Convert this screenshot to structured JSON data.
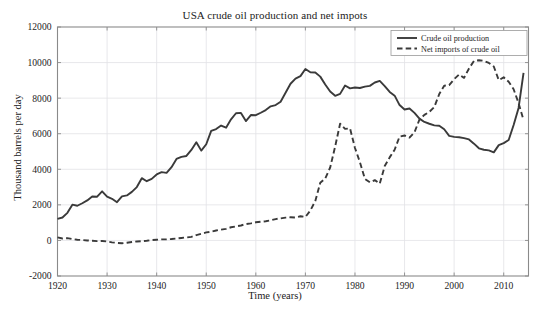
{
  "chart_data": {
    "type": "line",
    "title": "USA crude oil production and net impots",
    "xlabel": "Time (years)",
    "ylabel": "Thousand barrels per day",
    "xlim": [
      1920,
      2015
    ],
    "ylim": [
      -2000,
      12000
    ],
    "xticks": [
      1920,
      1930,
      1940,
      1950,
      1960,
      1970,
      1980,
      1990,
      2000,
      2010
    ],
    "yticks": [
      -2000,
      0,
      2000,
      4000,
      6000,
      8000,
      10000,
      12000
    ],
    "xtick_labels": [
      "1920",
      "1930",
      "1940",
      "1950",
      "1960",
      "1970",
      "1980",
      "1990",
      "2000",
      "2010"
    ],
    "ytick_labels": [
      "-2000",
      "0",
      "2000",
      "4000",
      "6000",
      "8000",
      "10000",
      "12000"
    ],
    "grid": true,
    "legend_position": "top-right",
    "line_color": "#3a3a3a",
    "grid_color": "#e2e2e6",
    "axis_color": "#8a8a8a",
    "series": [
      {
        "name": "Crude oil production",
        "style": "solid",
        "x": [
          1920,
          1921,
          1922,
          1923,
          1924,
          1925,
          1926,
          1927,
          1928,
          1929,
          1930,
          1931,
          1932,
          1933,
          1934,
          1935,
          1936,
          1937,
          1938,
          1939,
          1940,
          1941,
          1942,
          1943,
          1944,
          1945,
          1946,
          1947,
          1948,
          1949,
          1950,
          1951,
          1952,
          1953,
          1954,
          1955,
          1956,
          1957,
          1958,
          1959,
          1960,
          1961,
          1962,
          1963,
          1964,
          1965,
          1966,
          1967,
          1968,
          1969,
          1970,
          1971,
          1972,
          1973,
          1974,
          1975,
          1976,
          1977,
          1978,
          1979,
          1980,
          1981,
          1982,
          1983,
          1984,
          1985,
          1986,
          1987,
          1988,
          1989,
          1990,
          1991,
          1992,
          1993,
          1994,
          1995,
          1996,
          1997,
          1998,
          1999,
          2000,
          2001,
          2002,
          2003,
          2004,
          2005,
          2006,
          2007,
          2008,
          2009,
          2010,
          2011,
          2012,
          2013,
          2014
        ],
        "values": [
          1210,
          1290,
          1550,
          2010,
          1950,
          2090,
          2250,
          2470,
          2460,
          2760,
          2460,
          2340,
          2150,
          2480,
          2530,
          2730,
          3000,
          3500,
          3330,
          3460,
          3710,
          3840,
          3800,
          4120,
          4580,
          4700,
          4750,
          5090,
          5520,
          5050,
          5410,
          6160,
          6260,
          6460,
          6340,
          6810,
          7150,
          7170,
          6710,
          7050,
          7040,
          7180,
          7330,
          7540,
          7610,
          7800,
          8300,
          8810,
          9100,
          9240,
          9640,
          9460,
          9440,
          9210,
          8770,
          8370,
          8130,
          8240,
          8710,
          8550,
          8600,
          8570,
          8650,
          8690,
          8880,
          8970,
          8680,
          8350,
          8140,
          7610,
          7360,
          7420,
          7170,
          6850,
          6660,
          6560,
          6470,
          6450,
          6250,
          5880,
          5820,
          5800,
          5750,
          5680,
          5440,
          5180,
          5100,
          5060,
          4950,
          5360,
          5470,
          5650,
          6490,
          7450,
          9420
        ]
      },
      {
        "name": "Net imports of crude oil",
        "style": "dashed",
        "x": [
          1920,
          1921,
          1922,
          1923,
          1924,
          1925,
          1926,
          1927,
          1928,
          1929,
          1930,
          1931,
          1932,
          1933,
          1934,
          1935,
          1936,
          1937,
          1938,
          1939,
          1940,
          1941,
          1942,
          1943,
          1944,
          1945,
          1946,
          1947,
          1948,
          1949,
          1950,
          1951,
          1952,
          1953,
          1954,
          1955,
          1956,
          1957,
          1958,
          1959,
          1960,
          1961,
          1962,
          1963,
          1964,
          1965,
          1966,
          1967,
          1968,
          1969,
          1970,
          1971,
          1972,
          1973,
          1974,
          1975,
          1976,
          1977,
          1978,
          1979,
          1980,
          1981,
          1982,
          1983,
          1984,
          1985,
          1986,
          1987,
          1988,
          1989,
          1990,
          1991,
          1992,
          1993,
          1994,
          1995,
          1996,
          1997,
          1998,
          1999,
          2000,
          2001,
          2002,
          2003,
          2004,
          2005,
          2006,
          2007,
          2008,
          2009,
          2010,
          2011,
          2012,
          2013,
          2014
        ],
        "values": [
          170,
          110,
          130,
          80,
          40,
          20,
          0,
          -20,
          -40,
          -30,
          -60,
          -110,
          -140,
          -160,
          -130,
          -90,
          -60,
          -40,
          -20,
          20,
          40,
          60,
          60,
          80,
          110,
          140,
          170,
          200,
          300,
          370,
          450,
          490,
          560,
          610,
          650,
          740,
          790,
          840,
          920,
          960,
          1020,
          1050,
          1080,
          1130,
          1200,
          1240,
          1280,
          1300,
          1290,
          1360,
          1320,
          1680,
          2220,
          3240,
          3480,
          4100,
          5280,
          6560,
          6270,
          6300,
          5200,
          4400,
          3460,
          3270,
          3390,
          3190,
          4180,
          4670,
          5100,
          5840,
          5900,
          5780,
          6080,
          6790,
          7060,
          7230,
          7500,
          8230,
          8700,
          8730,
          9070,
          9330,
          9140,
          9670,
          10090,
          10130,
          10100,
          9980,
          9780,
          9010,
          9170,
          8920,
          8500,
          7720,
          6760
        ]
      }
    ]
  },
  "legend": {
    "items": [
      {
        "label": "Crude oil production",
        "style": "solid"
      },
      {
        "label": "Net imports of crude oil",
        "style": "dashed"
      }
    ]
  }
}
